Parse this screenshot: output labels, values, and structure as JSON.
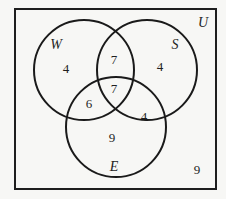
{
  "diagram": {
    "type": "venn-3",
    "universe": {
      "label": "U",
      "label_pos": [
        203,
        22
      ]
    },
    "colors": {
      "background": "#f7f7f5",
      "stroke": "#1a1a1a",
      "text": "#1f1f1f"
    },
    "frame": {
      "x": 15,
      "y": 9,
      "width": 201,
      "height": 180
    },
    "sets": [
      {
        "name": "W",
        "cx": 84,
        "cy": 70,
        "r": 50,
        "label_pos": [
          56,
          44
        ]
      },
      {
        "name": "S",
        "cx": 147,
        "cy": 70,
        "r": 50,
        "label_pos": [
          175,
          44
        ]
      },
      {
        "name": "E",
        "cx": 116,
        "cy": 127,
        "r": 50,
        "label_pos": [
          114,
          166
        ]
      }
    ],
    "regions": {
      "W_only": {
        "value": "4",
        "pos": [
          66,
          68
        ]
      },
      "S_only": {
        "value": "4",
        "pos": [
          160,
          66
        ]
      },
      "E_only": {
        "value": "9",
        "pos": [
          112,
          137
        ]
      },
      "W_and_S_only": {
        "value": "7",
        "pos": [
          114,
          59
        ]
      },
      "W_and_E_only": {
        "value": "6",
        "pos": [
          89,
          103
        ]
      },
      "S_and_E_only": {
        "value": "4",
        "pos": [
          144,
          116
        ]
      },
      "W_S_E": {
        "value": "7",
        "pos": [
          114,
          88
        ]
      },
      "outside": {
        "value": "9",
        "pos": [
          197,
          169
        ]
      }
    }
  }
}
